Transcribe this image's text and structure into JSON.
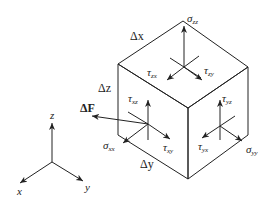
{
  "diagram": {
    "type": "stress-element",
    "colors": {
      "line": "#222222",
      "background": "#ffffff"
    },
    "cube_labels": {
      "dx": "Δx",
      "dz": "Δz",
      "dy": "Δy"
    },
    "force_label": "ΔF",
    "top_face": {
      "normal": {
        "sym": "σ",
        "sub": "zz"
      },
      "shear1": {
        "sym": "τ",
        "sub": "zx"
      },
      "shear2": {
        "sym": "τ",
        "sub": "zy"
      }
    },
    "left_face": {
      "normal": {
        "sym": "σ",
        "sub": "xx"
      },
      "shear1": {
        "sym": "τ",
        "sub": "xz"
      },
      "shear2": {
        "sym": "τ",
        "sub": "xy"
      }
    },
    "right_face": {
      "normal": {
        "sym": "σ",
        "sub": "yy"
      },
      "shear1": {
        "sym": "τ",
        "sub": "yz"
      },
      "shear2": {
        "sym": "τ",
        "sub": "yx"
      }
    },
    "axes": {
      "z": "z",
      "x": "x",
      "y": "y"
    }
  }
}
